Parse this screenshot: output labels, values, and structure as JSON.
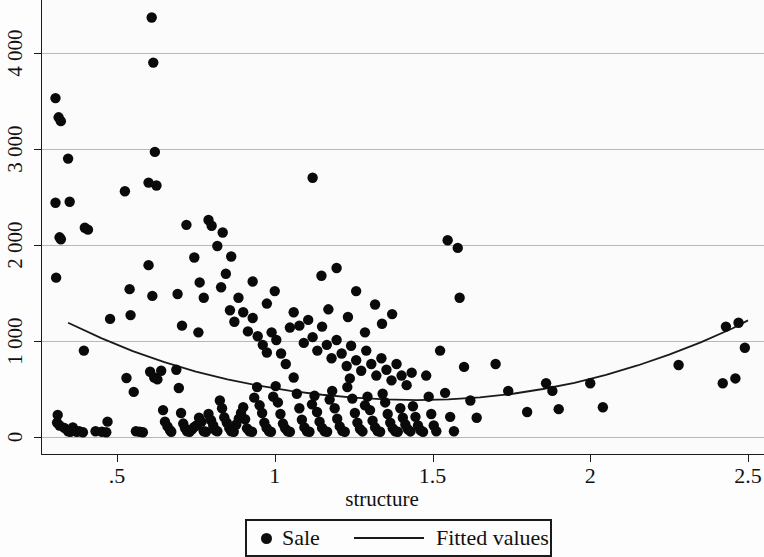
{
  "chart_data": {
    "type": "scatter",
    "title": "",
    "xlabel": "structure",
    "ylabel": "",
    "xlim": [
      0.3,
      2.52
    ],
    "ylim": [
      -180,
      4400
    ],
    "grid": true,
    "grid_axis": "y",
    "xticks": [
      0.5,
      1,
      1.5,
      2,
      2.5
    ],
    "xticklabels": [
      ".5",
      "1",
      "1.5",
      "2",
      "2.5"
    ],
    "yticks": [
      0,
      1000,
      2000,
      3000,
      4000
    ],
    "yticklabels": [
      "0",
      "1 000",
      "2 000",
      "3 000",
      "4 000"
    ],
    "legend_position": "below-center",
    "series": [
      {
        "name": "Sale",
        "marker": "circle",
        "color": "#0a0a0a",
        "points": [
          [
            0.305,
            3530
          ],
          [
            0.315,
            3330
          ],
          [
            0.322,
            3290
          ],
          [
            0.345,
            2900
          ],
          [
            0.305,
            2440
          ],
          [
            0.318,
            2080
          ],
          [
            0.322,
            2060
          ],
          [
            0.307,
            1660
          ],
          [
            0.312,
            230
          ],
          [
            0.31,
            150
          ],
          [
            0.318,
            120
          ],
          [
            0.333,
            95
          ],
          [
            0.345,
            60
          ],
          [
            0.352,
            55
          ],
          [
            0.36,
            100
          ],
          [
            0.372,
            55
          ],
          [
            0.38,
            60
          ],
          [
            0.392,
            50
          ],
          [
            0.35,
            2450
          ],
          [
            0.398,
            2180
          ],
          [
            0.408,
            2160
          ],
          [
            0.395,
            900
          ],
          [
            0.432,
            60
          ],
          [
            0.452,
            55
          ],
          [
            0.466,
            50
          ],
          [
            0.478,
            1230
          ],
          [
            0.47,
            160
          ],
          [
            0.525,
            2560
          ],
          [
            0.54,
            1540
          ],
          [
            0.543,
            1270
          ],
          [
            0.53,
            615
          ],
          [
            0.553,
            470
          ],
          [
            0.56,
            60
          ],
          [
            0.572,
            55
          ],
          [
            0.582,
            50
          ],
          [
            0.6,
            2650
          ],
          [
            0.61,
            4370
          ],
          [
            0.615,
            3900
          ],
          [
            0.62,
            2970
          ],
          [
            0.625,
            2620
          ],
          [
            0.6,
            1790
          ],
          [
            0.612,
            1470
          ],
          [
            0.605,
            680
          ],
          [
            0.618,
            620
          ],
          [
            0.628,
            600
          ],
          [
            0.64,
            690
          ],
          [
            0.646,
            280
          ],
          [
            0.652,
            160
          ],
          [
            0.66,
            110
          ],
          [
            0.668,
            70
          ],
          [
            0.672,
            55
          ],
          [
            0.688,
            700
          ],
          [
            0.696,
            510
          ],
          [
            0.703,
            250
          ],
          [
            0.71,
            140
          ],
          [
            0.716,
            90
          ],
          [
            0.722,
            60
          ],
          [
            0.73,
            55
          ],
          [
            0.738,
            80
          ],
          [
            0.745,
            105
          ],
          [
            0.752,
            120
          ],
          [
            0.76,
            200
          ],
          [
            0.768,
            160
          ],
          [
            0.775,
            60
          ],
          [
            0.782,
            55
          ],
          [
            0.79,
            240
          ],
          [
            0.798,
            175
          ],
          [
            0.805,
            120
          ],
          [
            0.812,
            70
          ],
          [
            0.818,
            60
          ],
          [
            0.826,
            380
          ],
          [
            0.833,
            300
          ],
          [
            0.84,
            205
          ],
          [
            0.848,
            150
          ],
          [
            0.856,
            90
          ],
          [
            0.862,
            60
          ],
          [
            0.87,
            55
          ],
          [
            0.878,
            130
          ],
          [
            0.886,
            190
          ],
          [
            0.893,
            250
          ],
          [
            0.9,
            310
          ],
          [
            0.906,
            185
          ],
          [
            0.912,
            90
          ],
          [
            0.92,
            60
          ],
          [
            0.928,
            55
          ],
          [
            0.935,
            410
          ],
          [
            0.944,
            520
          ],
          [
            0.952,
            330
          ],
          [
            0.96,
            250
          ],
          [
            0.967,
            150
          ],
          [
            0.974,
            95
          ],
          [
            0.982,
            60
          ],
          [
            0.988,
            55
          ],
          [
            0.995,
            420
          ],
          [
            1.003,
            530
          ],
          [
            1.01,
            360
          ],
          [
            1.018,
            240
          ],
          [
            1.026,
            140
          ],
          [
            1.033,
            90
          ],
          [
            1.041,
            60
          ],
          [
            1.048,
            55
          ],
          [
            0.72,
            2210
          ],
          [
            0.745,
            1870
          ],
          [
            0.762,
            1610
          ],
          [
            0.79,
            2260
          ],
          [
            0.8,
            2200
          ],
          [
            0.818,
            1990
          ],
          [
            0.83,
            1560
          ],
          [
            0.845,
            1700
          ],
          [
            0.858,
            1320
          ],
          [
            0.872,
            1200
          ],
          [
            0.885,
            1450
          ],
          [
            0.9,
            1300
          ],
          [
            0.915,
            1100
          ],
          [
            0.93,
            1240
          ],
          [
            0.946,
            1050
          ],
          [
            0.962,
            960
          ],
          [
            0.975,
            880
          ],
          [
            0.99,
            1090
          ],
          [
            1.005,
            1010
          ],
          [
            1.02,
            870
          ],
          [
            1.035,
            760
          ],
          [
            1.048,
            1140
          ],
          [
            0.692,
            1490
          ],
          [
            0.706,
            1160
          ],
          [
            0.758,
            1090
          ],
          [
            0.775,
            1450
          ],
          [
            0.835,
            2130
          ],
          [
            0.862,
            1880
          ],
          [
            0.93,
            1620
          ],
          [
            0.975,
            1390
          ],
          [
            1.0,
            1520
          ],
          [
            1.06,
            620
          ],
          [
            1.07,
            450
          ],
          [
            1.078,
            300
          ],
          [
            1.086,
            180
          ],
          [
            1.094,
            100
          ],
          [
            1.102,
            60
          ],
          [
            1.11,
            55
          ],
          [
            1.118,
            340
          ],
          [
            1.126,
            430
          ],
          [
            1.134,
            260
          ],
          [
            1.142,
            160
          ],
          [
            1.15,
            95
          ],
          [
            1.158,
            60
          ],
          [
            1.166,
            55
          ],
          [
            1.174,
            390
          ],
          [
            1.182,
            480
          ],
          [
            1.19,
            300
          ],
          [
            1.198,
            190
          ],
          [
            1.206,
            110
          ],
          [
            1.214,
            65
          ],
          [
            1.222,
            55
          ],
          [
            1.23,
            520
          ],
          [
            1.238,
            610
          ],
          [
            1.246,
            400
          ],
          [
            1.254,
            250
          ],
          [
            1.262,
            150
          ],
          [
            1.27,
            85
          ],
          [
            1.278,
            58
          ],
          [
            1.286,
            330
          ],
          [
            1.294,
            420
          ],
          [
            1.302,
            280
          ],
          [
            1.31,
            170
          ],
          [
            1.318,
            100
          ],
          [
            1.326,
            62
          ],
          [
            1.334,
            55
          ],
          [
            1.342,
            450
          ],
          [
            1.35,
            360
          ],
          [
            1.358,
            240
          ],
          [
            1.366,
            150
          ],
          [
            1.374,
            90
          ],
          [
            1.382,
            60
          ],
          [
            1.39,
            55
          ],
          [
            1.398,
            300
          ],
          [
            1.406,
            200
          ],
          [
            1.414,
            130
          ],
          [
            1.422,
            80
          ],
          [
            1.43,
            58
          ],
          [
            1.438,
            320
          ],
          [
            1.446,
            210
          ],
          [
            1.454,
            120
          ],
          [
            1.462,
            70
          ],
          [
            1.47,
            55
          ],
          [
            1.06,
            1300
          ],
          [
            1.078,
            1160
          ],
          [
            1.092,
            980
          ],
          [
            1.106,
            1220
          ],
          [
            1.12,
            1040
          ],
          [
            1.135,
            900
          ],
          [
            1.15,
            1150
          ],
          [
            1.165,
            960
          ],
          [
            1.18,
            820
          ],
          [
            1.196,
            1010
          ],
          [
            1.212,
            870
          ],
          [
            1.228,
            740
          ],
          [
            1.242,
            950
          ],
          [
            1.258,
            800
          ],
          [
            1.274,
            690
          ],
          [
            1.29,
            900
          ],
          [
            1.306,
            760
          ],
          [
            1.322,
            640
          ],
          [
            1.338,
            820
          ],
          [
            1.354,
            700
          ],
          [
            1.37,
            590
          ],
          [
            1.386,
            760
          ],
          [
            1.402,
            640
          ],
          [
            1.418,
            540
          ],
          [
            1.434,
            670
          ],
          [
            1.12,
            2700
          ],
          [
            1.148,
            1680
          ],
          [
            1.17,
            1330
          ],
          [
            1.196,
            1760
          ],
          [
            1.232,
            1250
          ],
          [
            1.258,
            1520
          ],
          [
            1.286,
            1090
          ],
          [
            1.318,
            1380
          ],
          [
            1.34,
            1180
          ],
          [
            1.372,
            1280
          ],
          [
            1.48,
            640
          ],
          [
            1.488,
            420
          ],
          [
            1.496,
            240
          ],
          [
            1.504,
            120
          ],
          [
            1.512,
            60
          ],
          [
            1.524,
            900
          ],
          [
            1.54,
            460
          ],
          [
            1.556,
            210
          ],
          [
            1.568,
            60
          ],
          [
            1.58,
            1970
          ],
          [
            1.586,
            1450
          ],
          [
            1.548,
            2050
          ],
          [
            1.6,
            730
          ],
          [
            1.62,
            380
          ],
          [
            1.64,
            200
          ],
          [
            1.7,
            760
          ],
          [
            1.74,
            480
          ],
          [
            1.8,
            260
          ],
          [
            1.86,
            560
          ],
          [
            1.88,
            480
          ],
          [
            1.9,
            290
          ],
          [
            2.0,
            560
          ],
          [
            2.04,
            310
          ],
          [
            2.28,
            750
          ],
          [
            2.43,
            1150
          ],
          [
            2.47,
            1190
          ],
          [
            2.49,
            930
          ],
          [
            2.46,
            610
          ],
          [
            2.42,
            560
          ]
        ]
      }
    ],
    "fit": {
      "name": "Fitted values",
      "color": "#1a1a1a",
      "type": "quadratic",
      "points": [
        [
          0.345,
          1190
        ],
        [
          0.45,
          1030
        ],
        [
          0.55,
          895
        ],
        [
          0.65,
          780
        ],
        [
          0.75,
          680
        ],
        [
          0.85,
          600
        ],
        [
          0.95,
          535
        ],
        [
          1.05,
          480
        ],
        [
          1.15,
          440
        ],
        [
          1.25,
          410
        ],
        [
          1.35,
          392
        ],
        [
          1.45,
          385
        ],
        [
          1.55,
          392
        ],
        [
          1.65,
          412
        ],
        [
          1.75,
          448
        ],
        [
          1.85,
          500
        ],
        [
          1.95,
          565
        ],
        [
          2.05,
          648
        ],
        [
          2.15,
          745
        ],
        [
          2.25,
          858
        ],
        [
          2.35,
          985
        ],
        [
          2.45,
          1130
        ],
        [
          2.5,
          1215
        ]
      ]
    }
  },
  "axes": {
    "x_title": "structure",
    "x_tick_labels": [
      ".5",
      "1",
      "1.5",
      "2",
      "2.5"
    ],
    "y_tick_labels": [
      "0",
      "1 000",
      "2 000",
      "3 000",
      "4 000"
    ]
  },
  "legend": {
    "sale_label": "Sale",
    "fitted_label": "Fitted values"
  }
}
